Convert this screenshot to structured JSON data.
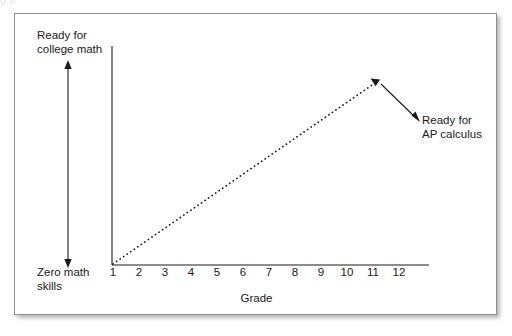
{
  "clipped_caption": "g                                                                    p",
  "figure": {
    "labels": {
      "top_left": "Ready for\ncollege math",
      "bottom_left": "Zero math\nskills",
      "annotation": "Ready for\nAP calculus"
    },
    "axis_title_x": "Grade",
    "colors": {
      "ink": "#1a1a1a",
      "frame_border": "#8d8d8d",
      "background": "#ffffff"
    }
  },
  "chart_data": {
    "type": "line",
    "title": "",
    "subtitle": "",
    "xlabel": "Grade",
    "ylabel": "",
    "x": [
      1,
      2,
      3,
      4,
      5,
      6,
      7,
      8,
      9,
      10,
      11,
      12
    ],
    "tick_labels": [
      "1",
      "2",
      "3",
      "4",
      "5",
      "6",
      "7",
      "8",
      "9",
      "10",
      "11",
      "12"
    ],
    "xlim": [
      1,
      12
    ],
    "ylim": [
      0,
      1
    ],
    "grid": false,
    "legend": false,
    "series": [
      {
        "name": "Math skill progression",
        "style": "dotted-arrow",
        "x": [
          1,
          11
        ],
        "values": [
          0,
          0.93
        ]
      }
    ],
    "y_axis_scale": {
      "bottom_label": "Zero math skills",
      "top_label": "Ready for college math",
      "bottom_value": 0,
      "top_value": 1,
      "marker": "double-headed-arrow"
    },
    "annotations": [
      {
        "text": "Ready for AP calculus",
        "points_to_x": 11,
        "points_to_y": 0.93,
        "arrow": true
      }
    ]
  }
}
